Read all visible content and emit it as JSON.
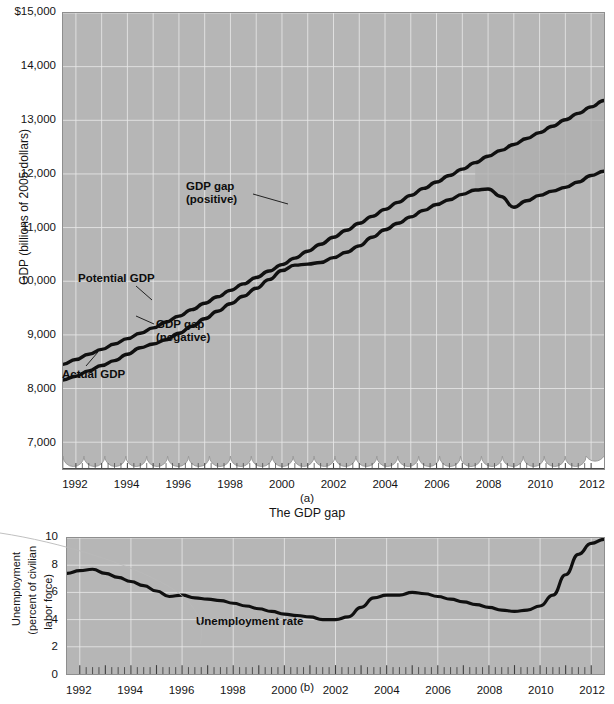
{
  "figure": {
    "panels": [
      {
        "id": "a",
        "caption": "(a)",
        "subtitle": "The GDP gap",
        "ylabel": "GDP (billions of 2005 dollars)",
        "yticks": [
          "$15,000",
          "14,000",
          "13,000",
          "12,000",
          "11,000",
          "10,000",
          "9,000",
          "8,000",
          "7,000"
        ],
        "xticks": [
          "1992",
          "1994",
          "1996",
          "1998",
          "2000",
          "2002",
          "2004",
          "2006",
          "2008",
          "2010",
          "2012"
        ],
        "annotations": [
          {
            "name": "gdp-gap-positive",
            "line1": "GDP gap",
            "line2": "(positive)"
          },
          {
            "name": "potential-gdp",
            "line1": "Potential GDP",
            "line2": ""
          },
          {
            "name": "gdp-gap-negative",
            "line1": "GDP gap",
            "line2": "(negative)"
          },
          {
            "name": "actual-gdp",
            "line1": "Actual GDP",
            "line2": ""
          }
        ]
      },
      {
        "id": "b",
        "caption": "(b)",
        "subtitle": "",
        "ylabel_line1": "Unemployment",
        "ylabel_line2": "(percent of civilian",
        "ylabel_line3": "labor force)",
        "yticks": [
          "10",
          "8",
          "6",
          "4",
          "2",
          "0"
        ],
        "xticks": [
          "1992",
          "1994",
          "1996",
          "1998",
          "2000",
          "2002",
          "2004",
          "2006",
          "2008",
          "2010",
          "2012"
        ],
        "annotations": [
          {
            "name": "unemployment-rate",
            "line1": "Unemployment rate",
            "line2": ""
          }
        ]
      }
    ]
  },
  "colors": {
    "plot_background": "#b6b6b6",
    "gridline": "#e8e8e8",
    "curve": "#101010",
    "gap_fill": "#9a9a9a",
    "axis": "#5a5a5a",
    "text": "#141414"
  },
  "chart_data": [
    {
      "type": "line",
      "title": "The GDP gap",
      "panel": "(a)",
      "xlabel": "",
      "ylabel": "GDP (billions of 2005 dollars)",
      "xlim": [
        1991.5,
        2012.5
      ],
      "ylim": [
        6500,
        15000
      ],
      "ytick_values": [
        15000,
        14000,
        13000,
        12000,
        11000,
        10000,
        9000,
        8000,
        7000
      ],
      "xtick_values": [
        1992,
        1994,
        1996,
        1998,
        2000,
        2002,
        2004,
        2006,
        2008,
        2010,
        2012
      ],
      "axis_break": true,
      "grid": true,
      "legend": "inline-annotations",
      "x": [
        1991.5,
        1992,
        1992.5,
        1993,
        1993.5,
        1994,
        1994.5,
        1995,
        1995.5,
        1996,
        1996.5,
        1997,
        1997.5,
        1998,
        1998.5,
        1999,
        1999.5,
        2000,
        2000.5,
        2001,
        2001.5,
        2002,
        2002.5,
        2003,
        2003.5,
        2004,
        2004.5,
        2005,
        2005.5,
        2006,
        2006.5,
        2007,
        2007.5,
        2008,
        2008.5,
        2009,
        2009.5,
        2010,
        2010.5,
        2011,
        2011.5,
        2012,
        2012.5
      ],
      "series": [
        {
          "name": "Actual GDP",
          "values": [
            8160,
            8230,
            8330,
            8430,
            8520,
            8640,
            8760,
            8830,
            8910,
            9030,
            9160,
            9300,
            9440,
            9580,
            9720,
            9870,
            10030,
            10200,
            10300,
            10320,
            10350,
            10440,
            10540,
            10660,
            10820,
            10960,
            11080,
            11200,
            11320,
            11430,
            11520,
            11620,
            11700,
            11720,
            11580,
            11380,
            11500,
            11600,
            11680,
            11750,
            11850,
            11970,
            12050
          ]
        },
        {
          "name": "Potential GDP",
          "values": [
            8450,
            8540,
            8640,
            8730,
            8830,
            8930,
            9030,
            9130,
            9240,
            9350,
            9470,
            9590,
            9710,
            9830,
            9950,
            10070,
            10190,
            10310,
            10430,
            10560,
            10690,
            10820,
            10950,
            11080,
            11210,
            11340,
            11470,
            11600,
            11730,
            11850,
            11970,
            12090,
            12210,
            12330,
            12440,
            12550,
            12660,
            12770,
            12890,
            13010,
            13130,
            13250,
            13370
          ]
        }
      ],
      "notes": [
        "Shaded positive GDP gap where Actual GDP exceeds Potential GDP, approximately 1998-2001 and briefly 2006-2007.",
        "Large negative GDP gap opens after 2008 as Actual GDP falls sharply while Potential GDP continues rising.",
        "Actual GDP reaches about 12,700 billion at its 2009 trough while Potential GDP reaches about 14,600 billion by 2012."
      ]
    },
    {
      "type": "line",
      "title": "Unemployment rate",
      "panel": "(b)",
      "xlabel": "",
      "ylabel": "Unemployment (percent of civilian labor force)",
      "xlim": [
        1991.5,
        2012.5
      ],
      "ylim": [
        0,
        10
      ],
      "ytick_values": [
        10,
        8,
        6,
        4,
        2,
        0
      ],
      "xtick_values": [
        1992,
        1994,
        1996,
        1998,
        2000,
        2002,
        2004,
        2006,
        2008,
        2010,
        2012
      ],
      "grid": true,
      "x": [
        1991.5,
        1992,
        1992.5,
        1993,
        1993.5,
        1994,
        1994.5,
        1995,
        1995.5,
        1996,
        1996.5,
        1997,
        1997.5,
        1998,
        1998.5,
        1999,
        1999.5,
        2000,
        2000.5,
        2001,
        2001.5,
        2002,
        2002.5,
        2003,
        2003.5,
        2004,
        2004.5,
        2005,
        2005.5,
        2006,
        2006.5,
        2007,
        2007.5,
        2008,
        2008.5,
        2009,
        2009.5,
        2010,
        2010.5,
        2011,
        2011.5,
        2012,
        2012.5
      ],
      "series": [
        {
          "name": "Unemployment rate",
          "values": [
            7.4,
            7.6,
            7.7,
            7.4,
            7.1,
            6.8,
            6.5,
            6.1,
            5.7,
            5.8,
            5.6,
            5.5,
            5.4,
            5.2,
            5.0,
            4.8,
            4.6,
            4.4,
            4.3,
            4.2,
            4.0,
            4.0,
            4.2,
            4.9,
            5.6,
            5.8,
            5.8,
            6.0,
            5.9,
            5.7,
            5.5,
            5.3,
            5.1,
            4.9,
            4.7,
            4.6,
            4.7,
            5.0,
            5.8,
            7.3,
            8.8,
            9.6,
            9.9
          ]
        }
      ],
      "notes": [
        "Unemployment starts near 7.5 percent in 1992, falls steadily to about 4 percent by 2000.",
        "Rises to about 6 percent in 2003, declines to about 4.5 percent by 2006-2007.",
        "Spikes sharply after 2008 to a peak near 10 percent in 2009-2010, then eases to about 8 percent in 2012."
      ]
    }
  ]
}
